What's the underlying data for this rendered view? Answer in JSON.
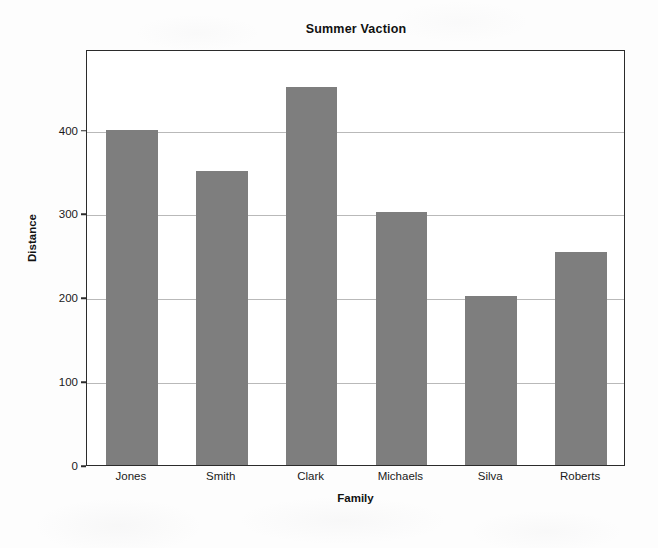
{
  "chart_data": {
    "type": "bar",
    "title": "Summer Vaction",
    "xlabel": "Family",
    "ylabel": "Distance",
    "categories": [
      "Jones",
      "Smith",
      "Clark",
      "Michaels",
      "Silva",
      "Roberts"
    ],
    "values": [
      400,
      350,
      451,
      302,
      201,
      254
    ],
    "ylim": [
      0,
      496
    ],
    "yticks": [
      0,
      100,
      200,
      300,
      400
    ],
    "ytick_labels": [
      "0",
      "100",
      "200",
      "300",
      "400"
    ],
    "grid": true,
    "grid_axis": "y",
    "legend": false,
    "bar_color": "#7e7e7e",
    "axis_color": "#2b2b2b",
    "grid_color": "#b9b9b9",
    "background_color": "#fdfdfd",
    "plot_background_color": "#ffffff"
  }
}
